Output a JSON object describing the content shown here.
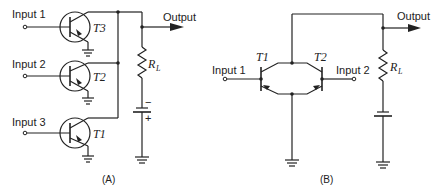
{
  "diagram_a": {
    "caption": "(A)",
    "inputs": [
      {
        "label": "Input 1",
        "transistor": "T3"
      },
      {
        "label": "Input 2",
        "transistor": "T2"
      },
      {
        "label": "Input 3",
        "transistor": "T1"
      }
    ],
    "transistor_labels": [
      "T3",
      "T2",
      "T1"
    ],
    "output_label": "Output",
    "resistor_label": "R",
    "resistor_subscript": "L",
    "battery_minus": "−",
    "battery_plus": "+"
  },
  "diagram_b": {
    "caption": "(B)",
    "input_1_label": "Input 1",
    "input_2_label": "Input 2",
    "transistor_labels": [
      "T1",
      "T2"
    ],
    "output_label": "Output",
    "resistor_label": "R",
    "resistor_subscript": "L"
  }
}
